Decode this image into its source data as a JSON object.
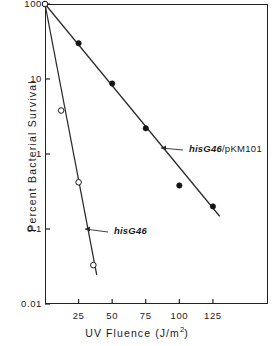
{
  "chart_data": {
    "type": "line",
    "title": "",
    "xlabel": "UV Fluence (J/m2)",
    "ylabel": "Percent Bacterial Survival",
    "xlabel_main": "UV  Fluence  (J/m",
    "xlabel_sup": "2",
    "xlabel_tail": ")",
    "yscale": "log",
    "xscale": "linear",
    "xlim": [
      0,
      166
    ],
    "ylim": [
      0.01,
      100
    ],
    "grid": false,
    "legend_position": "inline-annotations",
    "xticks": [
      25,
      50,
      75,
      100,
      125
    ],
    "xtick_labels": [
      "25",
      "50",
      "75",
      "100",
      "125"
    ],
    "yticks": [
      100,
      10,
      1,
      0.1,
      0.01
    ],
    "ytick_labels": [
      "100",
      "10",
      "1",
      "0.1",
      "0.01"
    ],
    "series": [
      {
        "name": "hisG46/pKM101",
        "label_italic": "hisG46",
        "label_plain": "/pKM101",
        "marker": "filled-circle",
        "marker_color": "#141414",
        "line_color": "#2a2a2a",
        "x": [
          0,
          25,
          50,
          75,
          100,
          125
        ],
        "values": [
          100,
          30,
          8.7,
          2.2,
          0.38,
          0.2
        ],
        "fit_line": {
          "x0": 0,
          "y0": 100,
          "x1": 130,
          "y1": 0.148
        }
      },
      {
        "name": "hisG46",
        "label_italic": "hisG46",
        "label_plain": "",
        "marker": "open-circle",
        "marker_color": "#ffffff",
        "line_color": "#2a2a2a",
        "x": [
          0,
          12,
          25,
          36
        ],
        "values": [
          100,
          3.8,
          0.42,
          0.033
        ],
        "fit_line": {
          "x0": 0,
          "y0": 100,
          "x1": 38.5,
          "y1": 0.0245
        }
      }
    ],
    "annotations": [
      {
        "name": "hisG46-pKM101-callout",
        "text_italic": "hisG46",
        "text_plain": "/pKM101",
        "arrow_from_x": 183,
        "arrow_from_y": 150,
        "arrow_to_x": 161,
        "arrow_to_y": 148
      },
      {
        "name": "hisG46-callout",
        "text_italic": "hisG46",
        "text_plain": "",
        "arrow_from_x": 108,
        "arrow_from_y": 232,
        "arrow_to_x": 85,
        "arrow_to_y": 229
      }
    ]
  },
  "axes": {
    "frame_color": "#222222",
    "tick_color": "#222222"
  }
}
